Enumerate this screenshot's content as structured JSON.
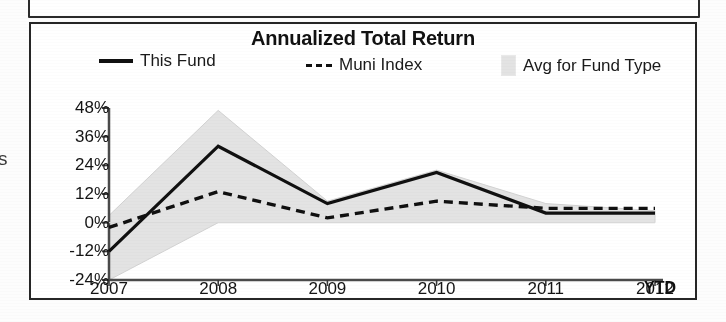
{
  "page": {
    "left_clipped_text": "s"
  },
  "chart_panel": {
    "title": "Annualized Total Return",
    "ytd_note": "YTD"
  },
  "legend": {
    "items": [
      {
        "label": "This Fund",
        "marker": "solid-line",
        "color": "#101010"
      },
      {
        "label": "Muni Index",
        "marker": "dashed-line",
        "color": "#101010"
      },
      {
        "label": "Avg for Fund Type",
        "marker": "filled-swatch",
        "color": "#e3e3e3"
      }
    ]
  },
  "chart_data": {
    "type": "line",
    "title": "Annualized Total Return",
    "xlabel": "",
    "ylabel": "",
    "categories": [
      "2007",
      "2008",
      "2009",
      "2010",
      "2011",
      "2012"
    ],
    "x_tick_labels": [
      "2007",
      "2008",
      "2009",
      "2010",
      "2011",
      "2012"
    ],
    "y_tick_labels": [
      "48%",
      "36%",
      "24%",
      "12%",
      "0%",
      "-12%",
      "-24%"
    ],
    "y_tick_values": [
      48,
      36,
      24,
      12,
      0,
      -12,
      -24
    ],
    "ylim": [
      -24,
      48
    ],
    "grid": false,
    "legend_position": "top",
    "units": "percent",
    "series": [
      {
        "name": "This Fund",
        "style": "solid",
        "color": "#101010",
        "values": [
          -12,
          32,
          8,
          21,
          4,
          4
        ]
      },
      {
        "name": "Muni Index",
        "style": "dashed",
        "color": "#101010",
        "values": [
          -2,
          13,
          2,
          9,
          6,
          6
        ]
      }
    ],
    "band": {
      "name": "Avg for Fund Type",
      "color": "#e3e3e3",
      "upper": [
        3,
        47,
        9,
        22,
        8,
        5
      ],
      "lower": [
        -24,
        0,
        0,
        0,
        0,
        0
      ]
    },
    "annotations": [
      {
        "text": "YTD",
        "near": "2012",
        "bold": true
      }
    ]
  }
}
